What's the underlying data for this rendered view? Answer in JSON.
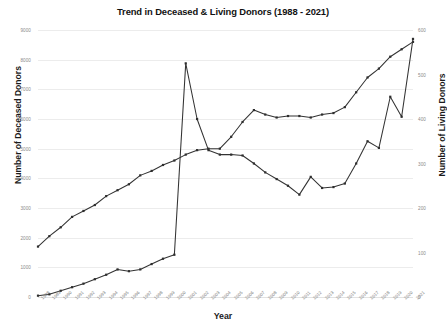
{
  "chart_data": {
    "type": "line",
    "title": "Trend in Deceased & Living Donors (1988 - 2021)",
    "xlabel": "Year",
    "ylabel": "Number of Deceased Donors",
    "y2label": "Number of Living Donors",
    "grid": true,
    "legend": "none",
    "ylim": [
      0,
      9000
    ],
    "y2lim": [
      0,
      600
    ],
    "yticks": [
      "0",
      "1000",
      "2000",
      "3000",
      "4000",
      "5000",
      "6000",
      "7000",
      "8000",
      "9000"
    ],
    "y2ticks": [
      "0",
      "100",
      "200",
      "300",
      "400",
      "500",
      "600"
    ],
    "categories": [
      "1988",
      "1989",
      "1990",
      "1991",
      "1992",
      "1993",
      "1994",
      "1995",
      "1996",
      "1997",
      "1998",
      "1999",
      "2000",
      "2001",
      "2002",
      "2003",
      "2004",
      "2005",
      "2006",
      "2007",
      "2008",
      "2009",
      "2010",
      "2011",
      "2012",
      "2013",
      "2014",
      "2015",
      "2016",
      "2017",
      "2018",
      "2019",
      "2020",
      "2021"
    ],
    "series": [
      {
        "name": "Number of Deceased Donors",
        "axis": "left",
        "values": [
          1700,
          2050,
          2350,
          2700,
          2900,
          3100,
          3400,
          3600,
          3800,
          4100,
          4250,
          4450,
          4600,
          4800,
          4950,
          5000,
          5000,
          5400,
          5900,
          6300,
          6150,
          6050,
          6100,
          6100,
          6050,
          6150,
          6200,
          6400,
          6900,
          7400,
          7700,
          8100,
          8350,
          8600
        ]
      },
      {
        "name": "Number of Living Donors",
        "axis": "right",
        "values": [
          3,
          6,
          14,
          22,
          30,
          40,
          50,
          62,
          58,
          62,
          74,
          86,
          95,
          525,
          400,
          330,
          320,
          320,
          318,
          300,
          280,
          265,
          250,
          230,
          270,
          245,
          247,
          255,
          300,
          350,
          335,
          450,
          405,
          580
        ]
      }
    ]
  }
}
